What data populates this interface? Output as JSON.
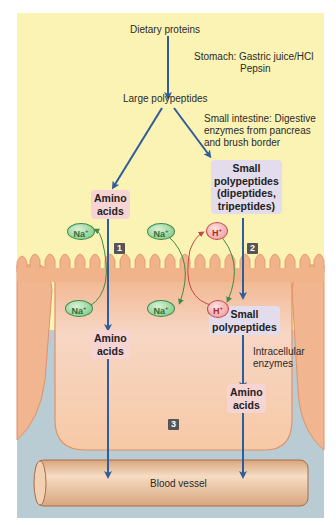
{
  "labels": {
    "dietary_proteins": "Dietary proteins",
    "stomach_line1": "Stomach: Gastric juice/HCl",
    "stomach_line2": "Pepsin",
    "large_polypeptides": "Large polypeptides",
    "small_intestine_line1": "Small intestine: Digestive",
    "small_intestine_line2": "enzymes from pancreas",
    "small_intestine_line3": "and brush border",
    "amino_acids_top_1": "Amino",
    "amino_acids_top_2": "acids",
    "small_poly_top_1": "Small",
    "small_poly_top_2": "polypeptides",
    "small_poly_top_3": "(dipeptides,",
    "small_poly_top_4": "tripeptides)",
    "amino_acids_left_1": "Amino",
    "amino_acids_left_2": "acids",
    "small_poly_mid_1": "Small",
    "small_poly_mid_2": "polypeptides",
    "intracellular_1": "Intracellular",
    "intracellular_2": "enzymes",
    "amino_acids_right_1": "Amino",
    "amino_acids_right_2": "acids",
    "blood_vessel": "Blood vessel"
  },
  "ions": {
    "na": "Na",
    "na_charge": "+",
    "h": "H",
    "h_charge": "+"
  },
  "steps": [
    "1",
    "2",
    "3"
  ],
  "colors": {
    "lumen": "#fbf3b4",
    "cell": "#f5c9a6",
    "cell_border": "#e0926a",
    "interstitial": "#b7c9d1",
    "arrow": "#2f5c9a",
    "amino_box": "#f6d4d4",
    "poly_box": "#e3dcec",
    "vessel": "#efc9a3"
  }
}
